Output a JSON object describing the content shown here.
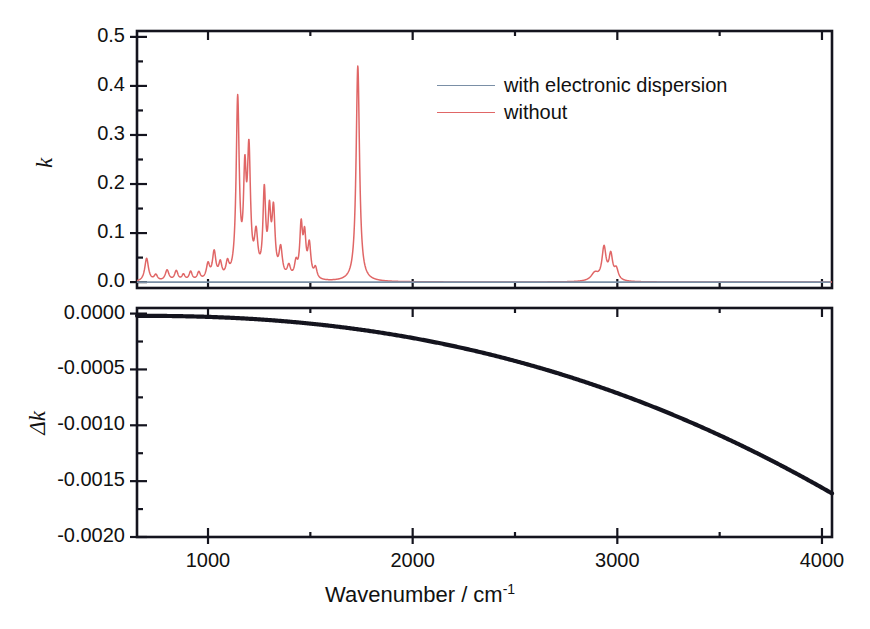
{
  "figure": {
    "x_axis_title_main": "Wavenumber / cm",
    "x_axis_title_sup": "-1",
    "top_panel_ylabel": "k",
    "bottom_panel_ylabel": "Δk"
  },
  "legend": {
    "position": "top-right-inside",
    "entries": [
      {
        "label": "with electronic dispersion",
        "color": "#7a8fa6"
      },
      {
        "label": "without",
        "color": "#e06666"
      }
    ]
  },
  "axes": {
    "x_ticks": [
      "1000",
      "2000",
      "3000",
      "4000"
    ],
    "x_tick_values": [
      1000,
      2000,
      3000,
      4000
    ],
    "x_minor_values": [
      1500,
      2500,
      3500
    ],
    "x_range": [
      653,
      4049
    ],
    "top_y_ticks": [
      "0.5",
      "0.4",
      "0.3",
      "0.2",
      "0.1",
      "0.0"
    ],
    "top_y_tick_values": [
      0.5,
      0.4,
      0.3,
      0.2,
      0.1,
      0.0
    ],
    "top_y_minor_values": [
      0.45,
      0.35,
      0.25,
      0.15,
      0.05
    ],
    "top_y_range": [
      -0.012,
      0.512
    ],
    "bottom_y_ticks": [
      "0.0000",
      "-0.0005",
      "-0.0010",
      "-0.0015",
      "-0.0020"
    ],
    "bottom_y_tick_values": [
      0.0,
      -0.0005,
      -0.001,
      -0.0015,
      -0.002
    ],
    "bottom_y_minor_values": [
      -0.00025,
      -0.00075,
      -0.00125,
      -0.00175
    ],
    "bottom_y_range": [
      -0.002,
      5e-05
    ]
  },
  "chart_data": {
    "type": "line",
    "title": "",
    "xlabel": "Wavenumber / cm-1",
    "ylabel": "k",
    "grid": false,
    "legend_position": "upper right",
    "panels": [
      {
        "name": "top-panel",
        "ylabel": "k",
        "ylim": [
          -0.012,
          0.512
        ],
        "xlim": [
          653,
          4049
        ],
        "series": [
          {
            "name": "without",
            "color": "#e06666",
            "description": "Infrared absorption index spectrum computed without electronic dispersion",
            "peaks": [
              {
                "center": 700,
                "height": 0.047,
                "width": 11
              },
              {
                "center": 745,
                "height": 0.012,
                "width": 10
              },
              {
                "center": 800,
                "height": 0.022,
                "width": 11
              },
              {
                "center": 845,
                "height": 0.02,
                "width": 10
              },
              {
                "center": 880,
                "height": 0.012,
                "width": 9
              },
              {
                "center": 915,
                "height": 0.018,
                "width": 9
              },
              {
                "center": 955,
                "height": 0.016,
                "width": 9
              },
              {
                "center": 1000,
                "height": 0.031,
                "width": 10
              },
              {
                "center": 1030,
                "height": 0.055,
                "width": 10
              },
              {
                "center": 1060,
                "height": 0.03,
                "width": 9
              },
              {
                "center": 1095,
                "height": 0.028,
                "width": 9
              },
              {
                "center": 1145,
                "height": 0.362,
                "width": 9
              },
              {
                "center": 1180,
                "height": 0.19,
                "width": 8
              },
              {
                "center": 1200,
                "height": 0.245,
                "width": 9
              },
              {
                "center": 1235,
                "height": 0.08,
                "width": 10
              },
              {
                "center": 1275,
                "height": 0.17,
                "width": 8
              },
              {
                "center": 1300,
                "height": 0.12,
                "width": 8
              },
              {
                "center": 1320,
                "height": 0.131,
                "width": 9
              },
              {
                "center": 1355,
                "height": 0.058,
                "width": 10
              },
              {
                "center": 1395,
                "height": 0.024,
                "width": 10
              },
              {
                "center": 1430,
                "height": 0.03,
                "width": 9
              },
              {
                "center": 1455,
                "height": 0.103,
                "width": 8
              },
              {
                "center": 1472,
                "height": 0.08,
                "width": 8
              },
              {
                "center": 1495,
                "height": 0.068,
                "width": 9
              },
              {
                "center": 1525,
                "height": 0.022,
                "width": 9
              },
              {
                "center": 1732,
                "height": 0.44,
                "width": 10
              },
              {
                "center": 2890,
                "height": 0.016,
                "width": 22
              },
              {
                "center": 2935,
                "height": 0.066,
                "width": 12
              },
              {
                "center": 2968,
                "height": 0.05,
                "width": 11
              },
              {
                "center": 2995,
                "height": 0.022,
                "width": 12
              }
            ]
          },
          {
            "name": "with electronic dispersion",
            "color": "#7a8fa6",
            "description": "Essentially flat near zero across the full range",
            "baseline": 0.0
          }
        ]
      },
      {
        "name": "bottom-panel",
        "ylabel": "Δk",
        "ylim": [
          -0.002,
          5e-05
        ],
        "xlim": [
          653,
          4049
        ],
        "series": [
          {
            "name": "delta-k",
            "color": "#14141e",
            "description": "Smooth monotonic decrease from ~0 at 650 cm-1 to about -0.00159 at 4049 cm-1",
            "points": [
              {
                "x": 653,
                "y": -2e-05
              },
              {
                "x": 800,
                "y": -3e-05
              },
              {
                "x": 1000,
                "y": -5e-05
              },
              {
                "x": 1200,
                "y": -8e-05
              },
              {
                "x": 1400,
                "y": -0.00012
              },
              {
                "x": 1600,
                "y": -0.00017
              },
              {
                "x": 1800,
                "y": -0.00023
              },
              {
                "x": 2000,
                "y": -0.0003
              },
              {
                "x": 2200,
                "y": -0.00039
              },
              {
                "x": 2400,
                "y": -0.00049
              },
              {
                "x": 2600,
                "y": -0.00061
              },
              {
                "x": 2800,
                "y": -0.00074
              },
              {
                "x": 3000,
                "y": -0.00089
              },
              {
                "x": 3200,
                "y": -0.00105
              },
              {
                "x": 3400,
                "y": -0.00123
              },
              {
                "x": 3600,
                "y": -0.00142
              },
              {
                "x": 3800,
                "y": -0.00163
              },
              {
                "x": 3950,
                "y": -0.0018
              },
              {
                "x": 4049,
                "y": -0.00159
              }
            ]
          }
        ]
      }
    ]
  }
}
